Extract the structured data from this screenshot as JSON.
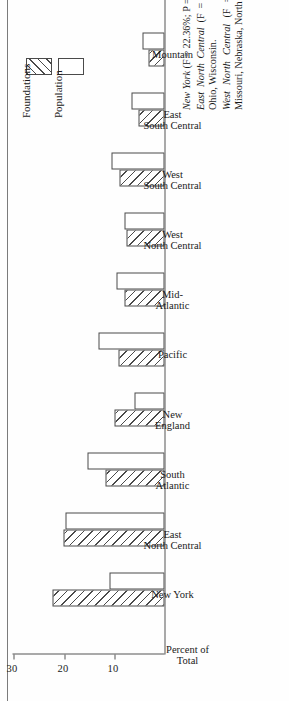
{
  "figure": {
    "orientation": "rotated-90-ccw",
    "page_rule": true
  },
  "legend": {
    "title": "",
    "items": [
      {
        "label": "Foundations",
        "pattern": "diagonal-hatch",
        "color": "#ffffff"
      },
      {
        "label": "Population",
        "pattern": "solid-white",
        "color": "#ffffff"
      }
    ]
  },
  "axis": {
    "title": "Percent of\nTotal",
    "ticks": [
      "10",
      "20",
      "30"
    ],
    "tick_values": [
      10,
      20,
      30
    ],
    "max": 30
  },
  "caption": {
    "lines": [
      {
        "em": "New York",
        "rest": " (F = 22.36%; P = 11%)."
      },
      {
        "em": "East North Central",
        "rest": "  (F = 20.14%;   P = 19.64%):  Illinois, Indiana, Michigan, Ohio, Wisconsin."
      },
      {
        "em": "West North Central",
        "rest": " (F = 7.50%; P = 8.04%): Iowa, Kansas, Minnesota, Missouri, Nebraska, North Dakota, South Dakota."
      }
    ]
  },
  "chart_data": {
    "type": "bar",
    "title": "",
    "xlabel": "",
    "ylabel": "Percent of Total",
    "ylim": [
      0,
      30
    ],
    "grid": false,
    "legend_position": "top-left",
    "orientation": "vertical-bars-rotated-90ccw",
    "categories": [
      "New York",
      "East\nNorth Central",
      "South\nAtlantic",
      "New\nEngland",
      "Pacific",
      "Mid-\nAtlantic",
      "West\nNorth Central",
      "West\nSouth Central",
      "East\nSouth Central",
      "Mountain"
    ],
    "series": [
      {
        "name": "Foundations",
        "values": [
          22.36,
          20.14,
          11.8,
          10.0,
          9.2,
          8.0,
          7.5,
          9.0,
          5.2,
          3.2
        ]
      },
      {
        "name": "Population",
        "values": [
          11.0,
          19.64,
          15.4,
          6.0,
          13.2,
          9.6,
          8.04,
          10.6,
          6.6,
          4.4
        ]
      }
    ]
  }
}
